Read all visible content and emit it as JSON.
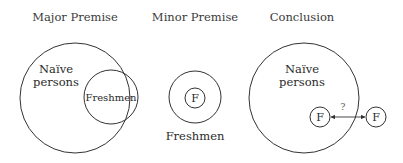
{
  "panels": {
    "major": {
      "title": "Major Premise",
      "outer_label_line1": "Naïve",
      "outer_label_line2": "persons",
      "inner_label": "Freshmen"
    },
    "minor": {
      "title": "Minor Premise",
      "inner_label": "F",
      "caption": "Freshmen"
    },
    "conclusion": {
      "title": "Conclusion",
      "outer_label_line1": "Naïve",
      "outer_label_line2": "persons",
      "left_f_label": "F",
      "right_f_label": "F",
      "arrow_label": "?"
    }
  },
  "colors": {
    "stroke": "#333333",
    "text": "#2a2a2a",
    "background": "#ffffff"
  }
}
